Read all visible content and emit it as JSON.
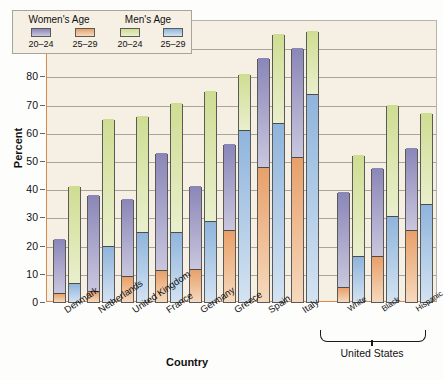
{
  "chart_data": {
    "type": "bar",
    "title": "",
    "xlabel": "Country",
    "ylabel": "Percent",
    "ylim": [
      0,
      100
    ],
    "ytick_values": [
      0,
      10,
      20,
      30,
      40,
      50,
      60,
      70,
      80,
      90,
      100
    ],
    "grid": true,
    "legend_position": "top-left",
    "legend_groups": [
      {
        "title": "Women's Age",
        "keys": [
          "20–24",
          "25–29"
        ],
        "colors": [
          "#9a96c4",
          "#eaa878"
        ]
      },
      {
        "title": "Men's Age",
        "keys": [
          "20–24",
          "25–29"
        ],
        "colors": [
          "#d6e39f",
          "#9dc0e2"
        ]
      }
    ],
    "categories": [
      "Denmark",
      "Netherlands",
      "United Kingdom",
      "France",
      "Germany",
      "Greece",
      "Spain",
      "Italy",
      "White",
      "Black",
      "Hispanic"
    ],
    "series": [
      {
        "name": "Women's Age 20–24",
        "color": "#9a96c4",
        "values": [
          22.5,
          38,
          36.5,
          53,
          41,
          56,
          86.5,
          90,
          39,
          47.5,
          54.5
        ]
      },
      {
        "name": "Women's Age 25–29",
        "color": "#eaa878",
        "values": [
          3,
          3.5,
          9,
          11,
          11.5,
          25,
          47.5,
          51,
          5,
          16,
          25
        ]
      },
      {
        "name": "Men's Age 20–24",
        "color": "#d6e39f",
        "values": [
          41,
          65,
          66,
          70.5,
          75,
          81,
          95,
          96,
          52,
          70,
          67
        ]
      },
      {
        "name": "Men's Age 25–29",
        "color": "#9dc0e2",
        "values": [
          6.5,
          19.5,
          24.5,
          24.5,
          28.5,
          60.5,
          63,
          73.5,
          16,
          30,
          34.5
        ]
      }
    ],
    "group_bracket": {
      "label": "United States",
      "members": [
        "White",
        "Black",
        "Hispanic"
      ]
    }
  }
}
